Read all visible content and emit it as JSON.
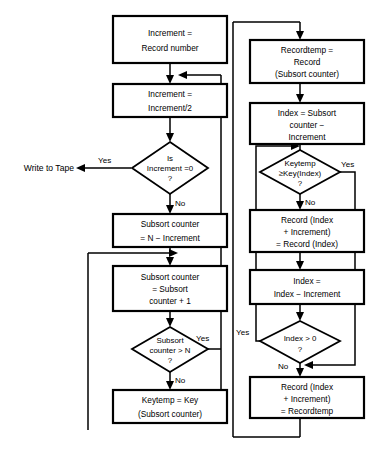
{
  "diagram": {
    "type": "flowchart",
    "background": "#ffffff",
    "line_color": "#000000"
  },
  "terminal": {
    "write_to_tape": "Write to Tape"
  },
  "processes": {
    "increment_init": {
      "lines": [
        "Increment =",
        "Record number"
      ]
    },
    "increment_half": {
      "lines": [
        "Increment =",
        "Increment/2"
      ]
    },
    "subsort_init": {
      "lines": [
        "Subsort counter",
        "= N − Increment"
      ]
    },
    "subsort_inc": {
      "lines": [
        "Subsort counter",
        "= Subsort",
        "counter + 1"
      ]
    },
    "keytemp_assign": {
      "lines": [
        "Keytemp = Key",
        "(Subsort counter)"
      ]
    },
    "recordtemp_assign": {
      "lines": [
        "Recordtemp =",
        "Record",
        "(Subsort counter)"
      ]
    },
    "index_assign": {
      "lines": [
        "Index = Subsort",
        "counter −",
        "Increment"
      ]
    },
    "record_shift": {
      "lines": [
        "Record (Index",
        "+ Increment)",
        "= Record (Index)"
      ]
    },
    "index_decrement": {
      "lines": [
        "Index =",
        "Index − Increment"
      ]
    },
    "record_store": {
      "lines": [
        "Record (Index",
        "+ Increment)",
        "= Recordtemp"
      ]
    }
  },
  "decisions": {
    "increment_zero": {
      "lines": [
        "Is",
        "Increment =0",
        "?"
      ],
      "yes": "Yes",
      "no": "No"
    },
    "subsort_gt_n": {
      "lines": [
        "Subsort",
        "counter > N",
        "?"
      ],
      "yes": "Yes",
      "no": "No"
    },
    "keytemp_cmp": {
      "lines": [
        "Keytemp",
        "≥Key(Index)",
        "?"
      ],
      "yes": "Yes",
      "no": "No"
    },
    "index_gt_zero": {
      "lines": [
        "Index > 0",
        "?"
      ],
      "yes": "Yes",
      "no": "No"
    }
  }
}
